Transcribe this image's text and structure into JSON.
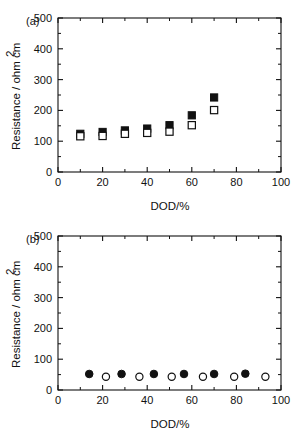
{
  "figure": {
    "panels": [
      {
        "tag": "(a)",
        "xlabel": "DOD/%",
        "ylabel": "Resistance / ohm cm",
        "ylabel_sup": "2",
        "xticks": [
          0,
          20,
          40,
          60,
          80,
          100
        ],
        "yticks": [
          0,
          100,
          200,
          300,
          400,
          500
        ],
        "xlim": [
          0,
          100
        ],
        "ylim": [
          0,
          500
        ]
      },
      {
        "tag": "(b)",
        "xlabel": "DOD/%",
        "ylabel": "Resistance / ohm cm",
        "ylabel_sup": "2",
        "xticks": [
          0,
          20,
          40,
          60,
          80,
          100
        ],
        "yticks": [
          0,
          100,
          200,
          300,
          400,
          500
        ],
        "xlim": [
          0,
          100
        ],
        "ylim": [
          0,
          500
        ]
      }
    ],
    "colors": {
      "axis": "#111111",
      "marker_filled": "#111111",
      "marker_open_edge": "#111111",
      "marker_open_face": "#ffffff",
      "background": "#ffffff"
    }
  },
  "chart_data": [
    {
      "type": "scatter",
      "title": "(a)",
      "xlabel": "DOD/%",
      "ylabel": "Resistance / ohm cm2",
      "xlim": [
        0,
        100
      ],
      "ylim": [
        0,
        500
      ],
      "xticks": [
        0,
        20,
        40,
        60,
        80,
        100
      ],
      "yticks": [
        0,
        100,
        200,
        300,
        400,
        500
      ],
      "grid": false,
      "legend": "none",
      "series": [
        {
          "name": "filled-square",
          "marker": "filled-square",
          "x": [
            10,
            20,
            30,
            40,
            50,
            60,
            70
          ],
          "y": [
            124,
            130,
            135,
            141,
            152,
            184,
            242
          ]
        },
        {
          "name": "open-square",
          "marker": "open-square",
          "x": [
            10,
            20,
            30,
            40,
            50,
            60,
            70
          ],
          "y": [
            116,
            117,
            124,
            127,
            131,
            152,
            201
          ]
        }
      ]
    },
    {
      "type": "scatter",
      "title": "(b)",
      "xlabel": "DOD/%",
      "ylabel": "Resistance / ohm cm2",
      "xlim": [
        0,
        100
      ],
      "ylim": [
        0,
        500
      ],
      "xticks": [
        0,
        20,
        40,
        60,
        80,
        100
      ],
      "yticks": [
        0,
        100,
        200,
        300,
        400,
        500
      ],
      "grid": false,
      "legend": "none",
      "series": [
        {
          "name": "filled-circle",
          "marker": "filled-circle",
          "x": [
            14,
            28.5,
            43,
            56.5,
            70,
            84
          ],
          "y": [
            52,
            52,
            52,
            52,
            52,
            53
          ]
        },
        {
          "name": "open-circle",
          "marker": "open-circle",
          "x": [
            21.5,
            36.5,
            51,
            65,
            79,
            93
          ],
          "y": [
            43,
            43,
            43,
            43,
            43,
            43
          ]
        }
      ]
    }
  ]
}
